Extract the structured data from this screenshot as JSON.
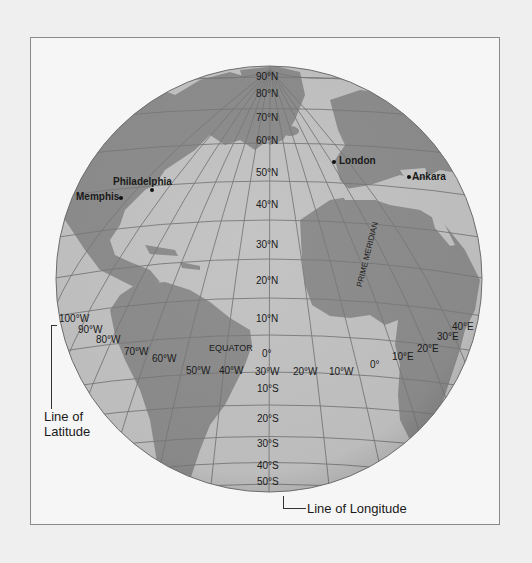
{
  "colors": {
    "page_bg": "#efefef",
    "frame_bg": "#f6f6f6",
    "frame_border": "#8a8a8a",
    "ocean": "#c4c4c4",
    "land": "#8e8e8e",
    "grid": "#7a7a7a",
    "text": "#1a1a1a"
  },
  "latitude_labels": [
    "90°N",
    "80°N",
    "70°N",
    "60°N",
    "50°N",
    "40°N",
    "30°N",
    "20°N",
    "10°N",
    "0°",
    "10°S",
    "20°S",
    "30°S",
    "40°S",
    "50°S"
  ],
  "longitude_labels": [
    "100°W",
    "90°W",
    "80°W",
    "70°W",
    "60°W",
    "50°W",
    "40°W",
    "30°W",
    "20°W",
    "10°W",
    "0°",
    "10°E",
    "20°E",
    "30°E",
    "40°E"
  ],
  "special_labels": {
    "equator": "EQUATOR",
    "prime_meridian": "PRIME MERIDIAN"
  },
  "cities": [
    {
      "name": "London"
    },
    {
      "name": "Ankara"
    },
    {
      "name": "Philadelphia"
    },
    {
      "name": "Memphis"
    }
  ],
  "callouts": {
    "latitude_line1": "Line of",
    "latitude_line2": "Latitude",
    "longitude": "Line of Longitude"
  }
}
